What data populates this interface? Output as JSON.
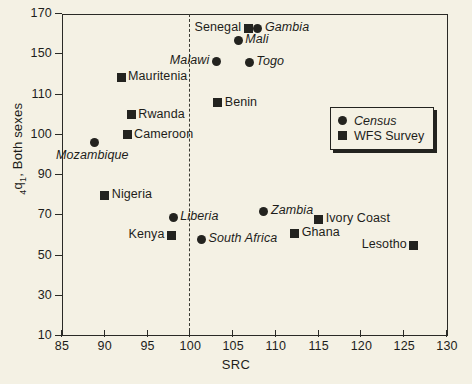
{
  "chart_data": {
    "type": "scatter",
    "title": "",
    "xlabel": "SRC",
    "ylabel": "4q1, Both sexes",
    "ylabel_prefix": "4",
    "ylabel_base": "q",
    "ylabel_sub": "1",
    "ylabel_rest": ", Both sexes",
    "xlim": [
      85,
      130
    ],
    "ylim": [
      10,
      170
    ],
    "xticks": [
      85,
      90,
      95,
      100,
      105,
      110,
      115,
      120,
      125,
      130
    ],
    "yticks": [
      170,
      150,
      110,
      100,
      90,
      70,
      50,
      30,
      10
    ],
    "grid": false,
    "reference_line": {
      "axis": "x",
      "value": 100,
      "style": "dashed"
    },
    "legend": {
      "position": "center-right",
      "entries": [
        {
          "label": "Census",
          "marker": "circle",
          "italic": true
        },
        {
          "label": "WFS Survey",
          "marker": "square",
          "italic": false
        }
      ]
    },
    "series": [
      {
        "name": "Census",
        "marker": "circle",
        "points": [
          {
            "label": "Gambia",
            "x": 107.9,
            "y": 163,
            "label_pos": "right"
          },
          {
            "label": "Mali",
            "x": 105.6,
            "y": 157,
            "label_pos": "right"
          },
          {
            "label": "Malawi",
            "x": 103.1,
            "y": 143,
            "label_pos": "left"
          },
          {
            "label": "Togo",
            "x": 106.9,
            "y": 142,
            "label_pos": "right"
          },
          {
            "label": "Mozambique",
            "x": 88.8,
            "y": 98,
            "label_pos": "below"
          },
          {
            "label": "Liberia",
            "x": 98.0,
            "y": 69,
            "label_pos": "right"
          },
          {
            "label": "South Africa",
            "x": 101.3,
            "y": 58,
            "label_pos": "right"
          },
          {
            "label": "Zambia",
            "x": 108.6,
            "y": 72,
            "label_pos": "right"
          }
        ]
      },
      {
        "name": "WFS Survey",
        "marker": "square",
        "points": [
          {
            "label": "Senegal",
            "x": 106.8,
            "y": 163,
            "label_pos": "left"
          },
          {
            "label": "Mauritenia",
            "x": 91.9,
            "y": 127,
            "label_pos": "right"
          },
          {
            "label": "Rwanda",
            "x": 93.1,
            "y": 105,
            "label_pos": "right"
          },
          {
            "label": "Cameroon",
            "x": 92.6,
            "y": 100,
            "label_pos": "right"
          },
          {
            "label": "Benin",
            "x": 103.2,
            "y": 108,
            "label_pos": "right"
          },
          {
            "label": "Nigeria",
            "x": 90.0,
            "y": 80,
            "label_pos": "right"
          },
          {
            "label": "Kenya",
            "x": 97.8,
            "y": 60,
            "label_pos": "left"
          },
          {
            "label": "Ivory Coast",
            "x": 115.0,
            "y": 68,
            "label_pos": "right"
          },
          {
            "label": "Ghana",
            "x": 112.2,
            "y": 61,
            "label_pos": "right"
          },
          {
            "label": "Lesotho",
            "x": 126.1,
            "y": 55,
            "label_pos": "left"
          }
        ]
      }
    ]
  },
  "colors": {
    "background": "#f4f1e4",
    "ink": "#23231f",
    "axis": "#2a2a26"
  }
}
